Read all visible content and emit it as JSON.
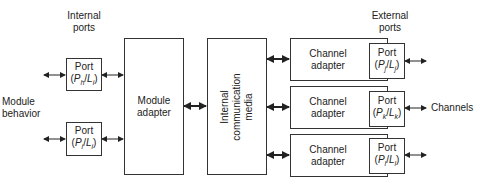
{
  "labels": {
    "internal_ports_line1": "Internal",
    "internal_ports_line2": "ports",
    "module_behavior_line1": "Module",
    "module_behavior_line2": "behavior",
    "external_ports_line1": "External",
    "external_ports_line2": "ports",
    "channels": "Channels"
  },
  "internal_ports": [
    {
      "title": "Port",
      "P": "P",
      "p_sub": "h",
      "L": "L",
      "l_sub": "i"
    },
    {
      "title": "Port",
      "P": "P",
      "p_sub": "i",
      "L": "L",
      "l_sub": "i"
    }
  ],
  "module_adapter": {
    "line1": "Module",
    "line2": "adapter"
  },
  "internal_media": {
    "line1": "Internal",
    "line2": "communication",
    "line3": "media"
  },
  "channel_adapters": [
    {
      "line1": "Channel",
      "line2": "adapter",
      "port": {
        "title": "Port",
        "P": "P",
        "p_sub": "j",
        "L": "L",
        "l_sub": "j"
      }
    },
    {
      "line1": "Channel",
      "line2": "adapter",
      "port": {
        "title": "Port",
        "P": "P",
        "p_sub": "k",
        "L": "L",
        "l_sub": "k"
      }
    },
    {
      "line1": "Channel",
      "line2": "adapter",
      "port": {
        "title": "Port",
        "P": "P",
        "p_sub": "l",
        "L": "L",
        "l_sub": "l"
      }
    }
  ],
  "colors": {
    "line": "#333333",
    "background": "#ffffff"
  }
}
